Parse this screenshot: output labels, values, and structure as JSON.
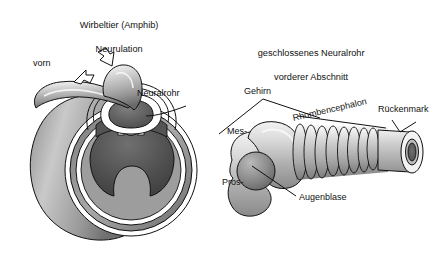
{
  "figure": {
    "language": "de",
    "background_color": "#ffffff",
    "ink_color": "#111111"
  },
  "left_panel": {
    "title_line1": "Wirbeltier (Amphib)",
    "title_line2": "Neurulation",
    "labels": {
      "anterior": "vorn",
      "neural_tube": "Neuralrohr"
    },
    "arrows": [
      {
        "name": "neural-fold-arrow-left",
        "direction": "up-right"
      },
      {
        "name": "neural-fold-arrow-right",
        "direction": "up-left"
      }
    ],
    "structures": [
      "neural-fold-left",
      "neural-fold-right",
      "neural-tube-lumen",
      "notochord",
      "archenteron",
      "embryo-body"
    ]
  },
  "right_panel": {
    "title_line1": "geschlossenes Neuralrohr",
    "title_line2": "vorderer Abschnitt",
    "labels": {
      "brain": "Gehirn",
      "mesencephalon": "Mes-",
      "prosencephalon": "Pros-",
      "rhombencephalon": "Rhombencephalon",
      "spinal_cord": "Rückenmark",
      "optic_vesicle": "Augenblase"
    },
    "rhombomere_count": 8,
    "structures": [
      "prosencephalon-vesicle",
      "optic-vesicle",
      "mesencephalon-bend",
      "rhombencephalon-segments",
      "spinal-cord-tube",
      "neural-canal-opening"
    ]
  },
  "palette": {
    "gray_light": "#e3e3e3",
    "gray_mid": "#b4b4b4",
    "gray_dark": "#7d7d7d",
    "gray_darker": "#5a5a5a",
    "gray_deep": "#3f3f3f",
    "outline": "#111111"
  }
}
